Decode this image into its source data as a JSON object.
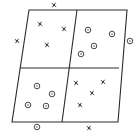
{
  "diagram": {
    "type": "partitioned-parallelogram",
    "colors": {
      "stroke": "#2b2b2b",
      "mark": "#333333",
      "background": "#ffffff"
    },
    "outline": [
      [
        29,
        10
      ],
      [
        127,
        10
      ],
      [
        118,
        122
      ],
      [
        12,
        122
      ]
    ],
    "dividers": {
      "horizontal": [
        [
          20,
          68
        ],
        [
          119,
          68
        ]
      ],
      "vertical": [
        [
          77,
          10
        ],
        [
          62,
          122
        ]
      ]
    },
    "legend_symbols": {
      "x": "cross-mark",
      "o": "circled-dot"
    },
    "regions": [
      {
        "name": "top-left",
        "symbol": "x",
        "points": [
          [
            40,
            24
          ],
          [
            64,
            29
          ],
          [
            47,
            45
          ]
        ]
      },
      {
        "name": "top-right",
        "symbol": "o",
        "points": [
          [
            88,
            30
          ],
          [
            112,
            34
          ],
          [
            94,
            46
          ],
          [
            81,
            54
          ]
        ]
      },
      {
        "name": "bottom-left",
        "symbol": "o",
        "points": [
          [
            37,
            86
          ],
          [
            52,
            94
          ],
          [
            28,
            105
          ],
          [
            46,
            106
          ]
        ]
      },
      {
        "name": "bottom-right",
        "symbol": "x",
        "points": [
          [
            76,
            83
          ],
          [
            103,
            82
          ],
          [
            92,
            93
          ],
          [
            80,
            105
          ]
        ]
      }
    ],
    "outside_points": [
      {
        "position": "top",
        "symbol": "x",
        "point": [
          54,
          5
        ]
      },
      {
        "position": "left",
        "symbol": "x",
        "point": [
          17,
          41
        ]
      },
      {
        "position": "right",
        "symbol": "o",
        "point": [
          130,
          41
        ]
      },
      {
        "position": "bottom-left",
        "symbol": "o",
        "point": [
          37,
          127
        ]
      },
      {
        "position": "bottom-right",
        "symbol": "x",
        "point": [
          89,
          128
        ]
      }
    ]
  }
}
